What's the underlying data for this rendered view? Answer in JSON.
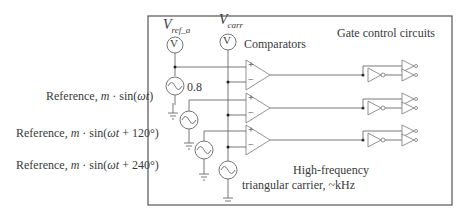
{
  "diagram": {
    "title_labels": {
      "vref": {
        "main": "V",
        "sub": "ref_a"
      },
      "vcarr": {
        "main": "V",
        "sub": "carr"
      },
      "voltmeter_glyph": "V"
    },
    "blocks": {
      "comparators": "Comparators",
      "gate_control": "Gate control circuits",
      "carrier_line1": "High-frequency",
      "carrier_line2": "triangular carrier, ~kHz"
    },
    "source_value": "0.8",
    "references": [
      {
        "prefix": "Reference, ",
        "m": "m",
        "mid": " · sin(",
        "w": "ωt",
        "suffix": ")"
      },
      {
        "prefix": "Reference, ",
        "m": "m",
        "mid": " · sin(",
        "w": "ωt",
        "suffix": " + 120°)"
      },
      {
        "prefix": "Reference, ",
        "m": "m",
        "mid": " · sin(",
        "w": "ωt",
        "suffix": " + 240°)"
      }
    ],
    "comparator_pins": {
      "plus": "+",
      "minus": "−"
    },
    "phases": 3
  }
}
